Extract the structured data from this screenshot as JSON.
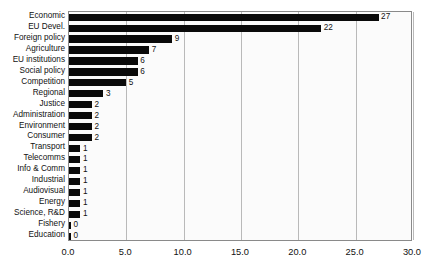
{
  "chart_data": {
    "type": "bar",
    "orientation": "horizontal",
    "title": "",
    "xlabel": "",
    "ylabel": "",
    "xlim": [
      0.0,
      30.0
    ],
    "xticks": [
      "0.0",
      "5.0",
      "10.0",
      "15.0",
      "20.0",
      "25.0",
      "30.0"
    ],
    "xtick_values": [
      0,
      5,
      10,
      15,
      20,
      25,
      30
    ],
    "grid": true,
    "legend": false,
    "bar_color": "#0a0a0a",
    "plot_background": "#fbfbfb",
    "gridline_color": "#b9b9b9",
    "categories": [
      "Economic",
      "EU Devel.",
      "Foreign policy",
      "Agriculture",
      "EU institutions",
      "Social policy",
      "Competition",
      "Regional",
      "Justice",
      "Administration",
      "Environment",
      "Consumer",
      "Transport",
      "Telecomms",
      "Info & Comm",
      "Industrial",
      "Audiovisual",
      "Energy",
      "Science, R&D",
      "Fishery",
      "Education"
    ],
    "values": [
      27,
      22,
      9,
      7,
      6,
      6,
      5,
      3,
      2,
      2,
      2,
      2,
      1,
      1,
      1,
      1,
      1,
      1,
      1,
      0,
      0
    ],
    "value_labels": [
      "27",
      "22",
      "9",
      "7",
      "6",
      "6",
      "5",
      "3",
      "2",
      "2",
      "2",
      "2",
      "1",
      "1",
      "1",
      "1",
      "1",
      "1",
      "1",
      "0",
      "0"
    ]
  },
  "caption": {
    "text": ""
  }
}
